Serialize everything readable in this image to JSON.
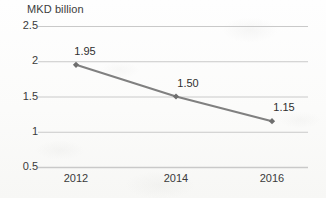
{
  "chart_data": {
    "type": "line",
    "title": "",
    "subtitle": "",
    "xlabel": "",
    "ylabel": "MKD billion",
    "categories": [
      "2012",
      "2014",
      "2016"
    ],
    "x": [
      2012,
      2014,
      2016
    ],
    "values": [
      1.95,
      1.5,
      1.15
    ],
    "point_labels": [
      "1.95",
      "1.50",
      "1.15"
    ],
    "series": [
      {
        "name": "MKD billion",
        "values": [
          1.95,
          1.5,
          1.15
        ]
      }
    ],
    "ylim": [
      0.5,
      2.5
    ],
    "yticks": [
      "2.5",
      "2",
      "1.5",
      "1",
      "0.5"
    ],
    "ytick_values": [
      2.5,
      2,
      1.5,
      1,
      0.5
    ],
    "xticks": [
      "2012",
      "2014",
      "2016"
    ],
    "grid": true,
    "grid_axis": "y",
    "legend": false,
    "legend_position": "none",
    "markers": true,
    "marker_shape": "diamond",
    "annotations": []
  },
  "style": {
    "line_color": "#808080",
    "marker_color": "#6e6e6e",
    "grid_color": "#c9c9c9",
    "text_color": "#3a3a3a",
    "background_color": "#fbfbfa"
  }
}
